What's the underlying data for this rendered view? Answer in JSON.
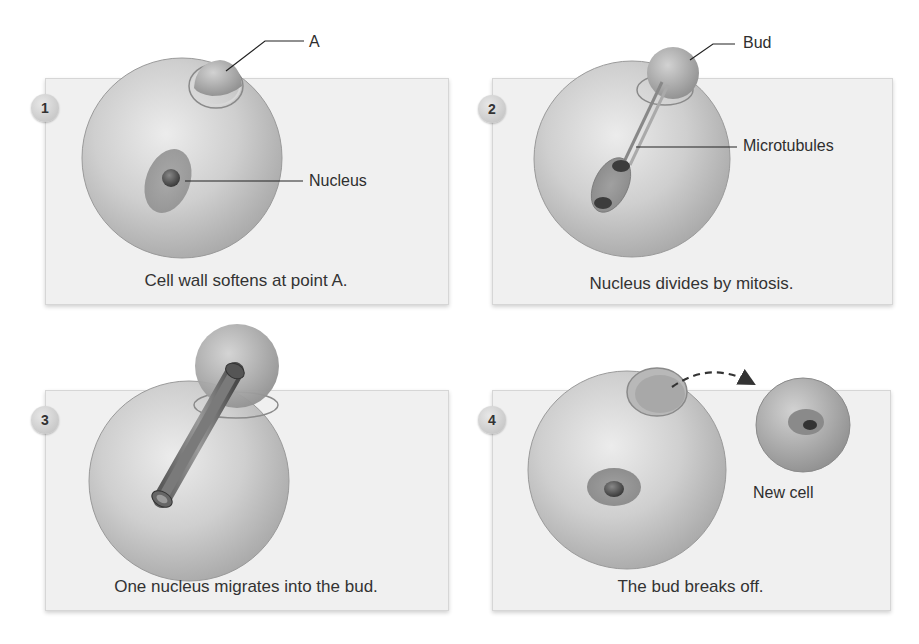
{
  "figure": {
    "panels": [
      {
        "number": "1",
        "caption": "Cell wall softens at point A.",
        "labels": {
          "a": "A",
          "nucleus": "Nucleus"
        }
      },
      {
        "number": "2",
        "caption": "Nucleus divides by mitosis.",
        "labels": {
          "bud": "Bud",
          "microtubules": "Microtubules"
        }
      },
      {
        "number": "3",
        "caption": "One nucleus migrates into the bud.",
        "labels": {}
      },
      {
        "number": "4",
        "caption": "The bud breaks off.",
        "labels": {
          "new_cell": "New cell"
        }
      }
    ]
  }
}
